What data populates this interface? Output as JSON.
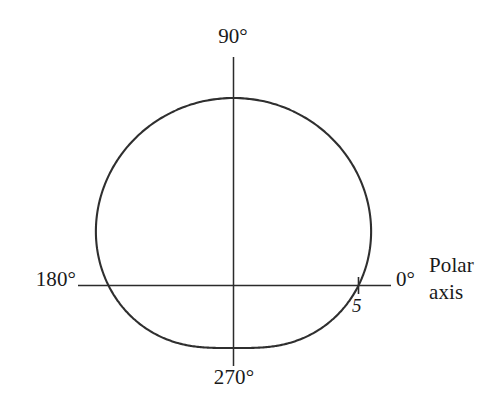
{
  "figure": {
    "background_color": "#ffffff",
    "line_color": "#2f2f2f",
    "axis_color": "#2b2b2b"
  },
  "labels": {
    "angle_90": "90°",
    "angle_180": "180°",
    "angle_270": "270°",
    "angle_0": "0°",
    "tick_5": "5",
    "polar_axis_line1": "Polar",
    "polar_axis_line2": "axis"
  },
  "chart_data": {
    "type": "line",
    "plot_style": "polar",
    "title": "",
    "xlabel": "",
    "ylabel": "",
    "equation": "r = 5 + 2.5 sin(theta)",
    "curve_name": "dimpled limacon",
    "legend": [],
    "grid": false,
    "angle_unit": "degrees",
    "angle_tick_labels": [
      "0°",
      "90°",
      "180°",
      "270°"
    ],
    "radial_tick_labels": [
      "5"
    ],
    "radial_tick_values": [
      5
    ],
    "rlim": [
      0,
      7.5
    ],
    "r_at_0deg": 5,
    "r_at_90deg": 7.5,
    "r_at_180deg": 5,
    "r_at_270deg": 2.5,
    "r_max": 7.5,
    "r_min": 2.5,
    "theta": [
      0,
      15,
      30,
      45,
      60,
      75,
      90,
      105,
      120,
      135,
      150,
      165,
      180,
      195,
      210,
      225,
      240,
      255,
      270,
      285,
      300,
      315,
      330,
      345,
      360
    ],
    "r": [
      5.0,
      5.65,
      6.25,
      6.77,
      7.17,
      7.41,
      7.5,
      7.41,
      7.17,
      6.77,
      6.25,
      5.65,
      5.0,
      4.35,
      3.75,
      3.23,
      2.83,
      2.59,
      2.5,
      2.59,
      2.83,
      3.23,
      3.75,
      4.35,
      5.0
    ],
    "polar_axis_label": "Polar axis"
  }
}
